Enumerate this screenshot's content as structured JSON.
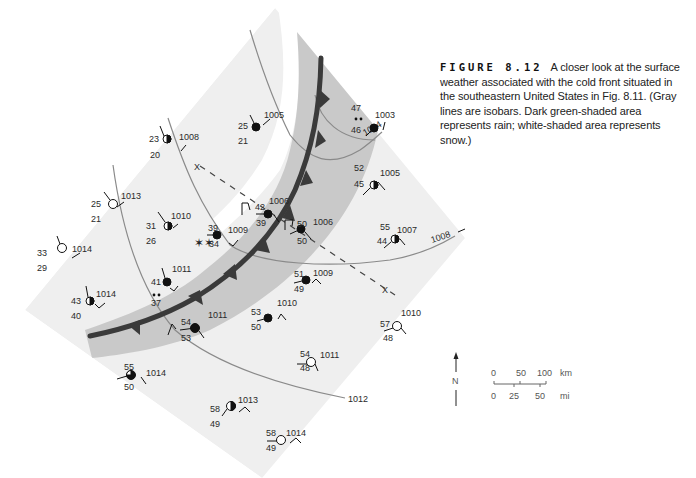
{
  "caption": {
    "figure_label": "FIGURE 8.12",
    "text": "A closer look at the surface weather associated with the cold front situated in the southeastern United States in Fig. 8.11. (Gray lines are isobars. Dark green-shaded area represents rain; white-shaded area represents snow.)"
  },
  "colors": {
    "light_region": "#efefef",
    "rain_band": "#c9c9c9",
    "snow": "#ffffff",
    "front": "#3a3a3a",
    "isobar": "#8a8a8a",
    "symbol": "#111111"
  },
  "isobars": [
    {
      "label": "1004"
    },
    {
      "label": "1008"
    },
    {
      "label": "1012"
    }
  ],
  "cross_section": {
    "end_label_a": "X",
    "end_label_b": "X"
  },
  "stations": [
    {
      "id": "s1",
      "temp": "25",
      "dew": "21",
      "pressure": "1005",
      "cover": "full"
    },
    {
      "id": "s2",
      "temp": "47",
      "dew": "46",
      "pressure": "1003",
      "cover": "full",
      "weather": "rain"
    },
    {
      "id": "s3",
      "temp": "23",
      "dew": "20",
      "pressure": "1008",
      "cover": "half"
    },
    {
      "id": "s4",
      "temp": "25",
      "dew": "21",
      "pressure": "1013",
      "cover": "clear"
    },
    {
      "id": "s5",
      "temp": "52",
      "dew": "45",
      "pressure": "1005",
      "cover": "half"
    },
    {
      "id": "s6",
      "temp": "31",
      "dew": "26",
      "pressure": "1010",
      "cover": "half"
    },
    {
      "id": "s7",
      "temp": "42",
      "dew": "39",
      "pressure": "1006",
      "cover": "full"
    },
    {
      "id": "s8",
      "temp": "39",
      "dew": "34",
      "pressure": "1009",
      "cover": "full",
      "weather": "snow"
    },
    {
      "id": "s9",
      "temp": "50",
      "dew": "50",
      "pressure": "1006",
      "cover": "full"
    },
    {
      "id": "s10",
      "temp": "55",
      "dew": "44",
      "pressure": "1007",
      "cover": "half"
    },
    {
      "id": "s11",
      "temp": "33",
      "dew": "29",
      "pressure": "1014",
      "cover": "clear"
    },
    {
      "id": "s12",
      "temp": "41",
      "dew": "37",
      "pressure": "1011",
      "cover": "full",
      "weather": "rain"
    },
    {
      "id": "s13",
      "temp": "51",
      "dew": "49",
      "pressure": "1009",
      "cover": "full"
    },
    {
      "id": "s14",
      "temp": "43",
      "dew": "40",
      "pressure": "1014",
      "cover": "half"
    },
    {
      "id": "s15",
      "temp": "54",
      "dew": "53",
      "pressure": "1011",
      "cover": "full"
    },
    {
      "id": "s16",
      "temp": "53",
      "dew": "50",
      "pressure": "1010",
      "cover": "full"
    },
    {
      "id": "s17",
      "temp": "57",
      "dew": "48",
      "pressure": "1010",
      "cover": "clear"
    },
    {
      "id": "s18",
      "temp": "54",
      "dew": "48",
      "pressure": "1011",
      "cover": "clear"
    },
    {
      "id": "s19",
      "temp": "55",
      "dew": "50",
      "pressure": "1014",
      "cover": "three-quarter"
    },
    {
      "id": "s20",
      "temp": "58",
      "dew": "49",
      "pressure": "1013",
      "cover": "half"
    },
    {
      "id": "s21",
      "temp": "58",
      "dew": "49",
      "pressure": "1014",
      "cover": "clear"
    }
  ],
  "north_arrow": {
    "label": "N"
  },
  "scale_bar": {
    "km_ticks": [
      "0",
      "50",
      "100"
    ],
    "km_unit": "km",
    "mi_ticks": [
      "0",
      "25",
      "50"
    ],
    "mi_unit": "mi"
  }
}
